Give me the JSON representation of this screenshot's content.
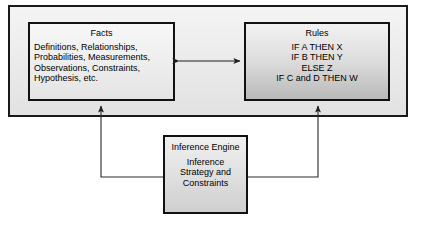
{
  "diagram": {
    "type": "expert-system-architecture",
    "container": {
      "name": "knowledge-base"
    },
    "facts": {
      "title": "Facts",
      "lines": [
        "Definitions, Relationships,",
        "Probabilities, Measurements,",
        "Observations, Constraints,",
        "Hypothesis, etc."
      ]
    },
    "rules": {
      "title": "Rules",
      "lines": [
        "IF A THEN X",
        "IF B THEN Y",
        "ELSE Z",
        "IF C and D THEN W"
      ]
    },
    "inference": {
      "title_lines": [
        "Inference",
        "Engine"
      ],
      "body_lines": [
        "Inference",
        "Strategy and",
        "Constraints"
      ]
    },
    "connectors": [
      {
        "name": "facts-rules-link",
        "from": "Facts",
        "to": "Rules",
        "arrowheads": "both"
      },
      {
        "name": "inference-facts-link",
        "from": "Inference Engine",
        "to": "Facts",
        "arrowheads": "end"
      },
      {
        "name": "inference-rules-link",
        "from": "Inference Engine",
        "to": "Rules",
        "arrowheads": "end"
      }
    ],
    "colors": {
      "background": "#ffffff",
      "container_fill": "#eaeaea",
      "facts_fill": "#efefef",
      "rules_fill": "#dcdcdc",
      "inference_fill": "#e0e0e0",
      "border": "#111111",
      "text": "#000000",
      "connector": "#2b2b2b"
    }
  }
}
